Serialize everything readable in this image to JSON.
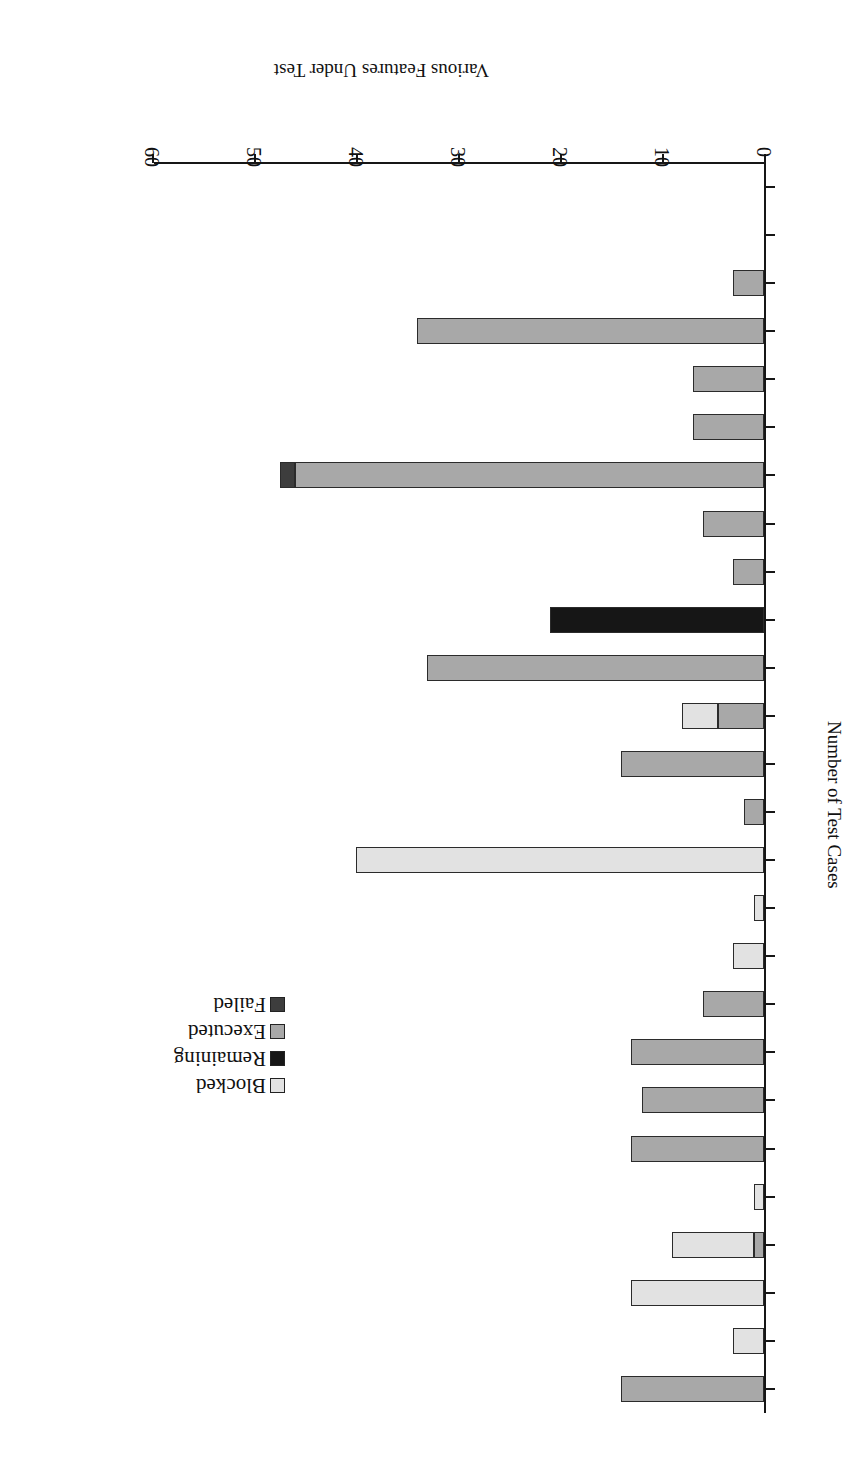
{
  "chart_data": {
    "type": "bar",
    "orientation": "horizontal",
    "stacked": true,
    "title": "",
    "xlabel": "Various Features Under Test",
    "ylabel": "Number of Test Cases",
    "ylim": [
      0,
      60
    ],
    "yticks": [
      0,
      10,
      20,
      30,
      40,
      50,
      60
    ],
    "ytick_labels": [
      "0",
      "10",
      "20",
      "30",
      "40",
      "50",
      "60"
    ],
    "grid": false,
    "legend_position": "upper-left",
    "legend": [
      "Blocked",
      "Remaining",
      "Executed",
      "Failed"
    ],
    "colors": {
      "Blocked": "#e2e2e2",
      "Remaining": "#161616",
      "Executed": "#a8a8a8",
      "Failed": "#3d3d3d"
    },
    "categories": [
      "F1",
      "F2",
      "F3",
      "F4",
      "F5",
      "F6",
      "F7",
      "F8",
      "F9",
      "F10",
      "F11",
      "F12",
      "F13",
      "F14",
      "F15",
      "F16",
      "F17",
      "F18",
      "F19",
      "F20",
      "F21",
      "F22",
      "F23",
      "F24",
      "F25",
      "F26"
    ],
    "series": [
      {
        "name": "Executed",
        "values": [
          14,
          0,
          0,
          1,
          0,
          13,
          12,
          13,
          0,
          6,
          2,
          0,
          0,
          2,
          14,
          4.5,
          33,
          0,
          3,
          6,
          46,
          7,
          7,
          34,
          0,
          3
        ]
      },
      {
        "name": "Blocked",
        "values": [
          0,
          3,
          13,
          8,
          1,
          0,
          0,
          0,
          3,
          0,
          0,
          40,
          0,
          0,
          0,
          3.5,
          0,
          0,
          0,
          0,
          0,
          0,
          0,
          0,
          0,
          0
        ]
      },
      {
        "name": "Remaining",
        "values": [
          0,
          0,
          0,
          0,
          0,
          0,
          0,
          0,
          0,
          0,
          0,
          0,
          0,
          0,
          0,
          0,
          0,
          21,
          0,
          0,
          0,
          0,
          0,
          0,
          0,
          0
        ]
      },
      {
        "name": "Failed",
        "values": [
          0,
          0,
          0,
          0,
          0,
          0,
          0,
          0,
          0,
          0,
          0,
          0,
          0,
          0,
          0,
          0,
          0,
          0,
          0,
          0,
          1.5,
          0,
          0,
          0,
          0,
          0
        ]
      }
    ],
    "bars": [
      {
        "category": "F1",
        "segments": [
          {
            "series": "Executed",
            "value": 14
          }
        ]
      },
      {
        "category": "F2",
        "segments": [
          {
            "series": "Blocked",
            "value": 3
          }
        ]
      },
      {
        "category": "F3",
        "segments": [
          {
            "series": "Blocked",
            "value": 13
          }
        ]
      },
      {
        "category": "F4",
        "segments": [
          {
            "series": "Executed",
            "value": 1
          },
          {
            "series": "Blocked",
            "value": 8
          }
        ]
      },
      {
        "category": "F5",
        "segments": [
          {
            "series": "Blocked",
            "value": 1
          }
        ]
      },
      {
        "category": "F6",
        "segments": [
          {
            "series": "Executed",
            "value": 13
          }
        ]
      },
      {
        "category": "F7",
        "segments": [
          {
            "series": "Executed",
            "value": 12
          }
        ]
      },
      {
        "category": "F8",
        "segments": [
          {
            "series": "Executed",
            "value": 13
          }
        ]
      },
      {
        "category": "F9",
        "segments": [
          {
            "series": "Executed",
            "value": 6
          }
        ]
      },
      {
        "category": "F10",
        "segments": [
          {
            "series": "Blocked",
            "value": 3
          }
        ]
      },
      {
        "category": "F11",
        "segments": [
          {
            "series": "Blocked",
            "value": 1
          }
        ]
      },
      {
        "category": "F12",
        "segments": [
          {
            "series": "Blocked",
            "value": 40
          }
        ]
      },
      {
        "category": "F13",
        "segments": [
          {
            "series": "Executed",
            "value": 2
          }
        ]
      },
      {
        "category": "F14",
        "segments": [
          {
            "series": "Executed",
            "value": 14
          }
        ]
      },
      {
        "category": "F15",
        "segments": [
          {
            "series": "Executed",
            "value": 4.5
          },
          {
            "series": "Blocked",
            "value": 3.5
          }
        ]
      },
      {
        "category": "F16",
        "segments": [
          {
            "series": "Executed",
            "value": 33
          }
        ]
      },
      {
        "category": "F17",
        "segments": [
          {
            "series": "Remaining",
            "value": 21
          }
        ]
      },
      {
        "category": "F18",
        "segments": [
          {
            "series": "Executed",
            "value": 3
          }
        ]
      },
      {
        "category": "F19",
        "segments": [
          {
            "series": "Executed",
            "value": 6
          }
        ]
      },
      {
        "category": "F20",
        "segments": [
          {
            "series": "Executed",
            "value": 46
          },
          {
            "series": "Failed",
            "value": 1.5
          }
        ]
      },
      {
        "category": "F21",
        "segments": [
          {
            "series": "Executed",
            "value": 7
          }
        ]
      },
      {
        "category": "F22",
        "segments": [
          {
            "series": "Executed",
            "value": 7
          }
        ]
      },
      {
        "category": "F23",
        "segments": [
          {
            "series": "Executed",
            "value": 34
          }
        ]
      },
      {
        "category": "F24",
        "segments": [
          {
            "series": "Executed",
            "value": 3
          }
        ]
      }
    ]
  }
}
